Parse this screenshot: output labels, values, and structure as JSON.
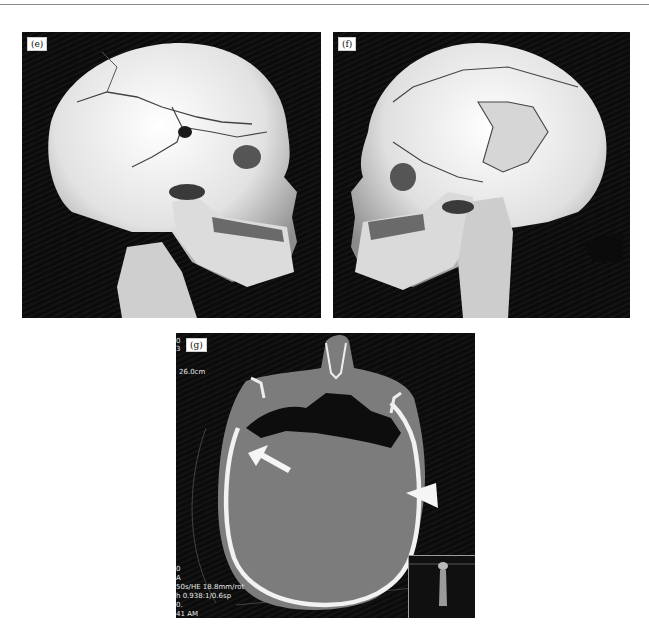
{
  "figure": {
    "panels": [
      {
        "id": "e",
        "label": "(e)",
        "description": "3D CT volume rendering of skull, right lateral oblique view, showing comminuted fractures with depressed defect in temporal-parietal region"
      },
      {
        "id": "f",
        "label": "(f)",
        "description": "3D CT volume rendering of skull, left lateral oblique view, showing extensive fracture lines across parietal bone"
      },
      {
        "id": "g",
        "label": "(g)",
        "description": "Axial CT slice (bone window) with arrow and arrowhead annotations"
      }
    ],
    "ct_overlay": {
      "top_left": [
        "0",
        "3"
      ],
      "fov": "26.0cm",
      "bottom_left": [
        "0",
        "A",
        "50s/HE 18.8mm/rot",
        "h 0.938:1/0.6sp",
        "0.",
        "41 AM"
      ]
    },
    "annotations": {
      "arrow": "arrow pointing to fracture / air at right frontal region",
      "arrowhead": "arrowhead pointing to fracture at left temporal region"
    },
    "colors": {
      "background": "#ffffff",
      "panel_bg": "#0b0b0b",
      "bone": "#ececec",
      "soft_tissue": "#7a7a7a"
    }
  }
}
